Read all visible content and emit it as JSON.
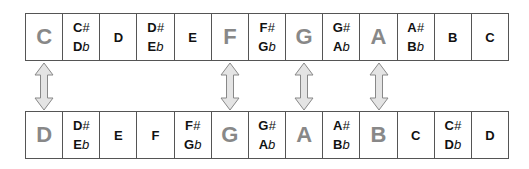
{
  "top_row": [
    {
      "type": "single",
      "note": "C",
      "highlight": true
    },
    {
      "type": "double",
      "line1": "C",
      "acc1": "#",
      "line2": "D",
      "acc2": "b"
    },
    {
      "type": "single",
      "note": "D",
      "highlight": false
    },
    {
      "type": "double",
      "line1": "D",
      "acc1": "#",
      "line2": "E",
      "acc2": "b"
    },
    {
      "type": "single",
      "note": "E",
      "highlight": false
    },
    {
      "type": "single",
      "note": "F",
      "highlight": true
    },
    {
      "type": "double",
      "line1": "F",
      "acc1": "#",
      "line2": "G",
      "acc2": "b"
    },
    {
      "type": "single",
      "note": "G",
      "highlight": true
    },
    {
      "type": "double",
      "line1": "G",
      "acc1": "#",
      "line2": "A",
      "acc2": "b"
    },
    {
      "type": "single",
      "note": "A",
      "highlight": true
    },
    {
      "type": "double",
      "line1": "A",
      "acc1": "#",
      "line2": "B",
      "acc2": "b"
    },
    {
      "type": "single",
      "note": "B",
      "highlight": false
    },
    {
      "type": "single",
      "note": "C",
      "highlight": false
    }
  ],
  "bottom_row": [
    {
      "type": "single",
      "note": "D",
      "highlight": true
    },
    {
      "type": "double",
      "line1": "D",
      "acc1": "#",
      "line2": "E",
      "acc2": "b"
    },
    {
      "type": "single",
      "note": "E",
      "highlight": false
    },
    {
      "type": "single",
      "note": "F",
      "highlight": false
    },
    {
      "type": "double",
      "line1": "F",
      "acc1": "#",
      "line2": "G",
      "acc2": "b"
    },
    {
      "type": "single",
      "note": "G",
      "highlight": true
    },
    {
      "type": "double",
      "line1": "G",
      "acc1": "#",
      "line2": "A",
      "acc2": "b"
    },
    {
      "type": "single",
      "note": "A",
      "highlight": true
    },
    {
      "type": "double",
      "line1": "A",
      "acc1": "#",
      "line2": "B",
      "acc2": "b"
    },
    {
      "type": "single",
      "note": "B",
      "highlight": true
    },
    {
      "type": "single",
      "note": "C",
      "highlight": false
    },
    {
      "type": "double",
      "line1": "C",
      "acc1": "#",
      "line2": "D",
      "acc2": "b"
    },
    {
      "type": "single",
      "note": "D",
      "highlight": false
    }
  ],
  "arrow_columns": [
    0,
    5,
    7,
    9
  ],
  "colors": {
    "border": "#555555",
    "highlight_text": "#888888",
    "arrow_fill": "#e4e4e4",
    "arrow_stroke": "#888888"
  }
}
